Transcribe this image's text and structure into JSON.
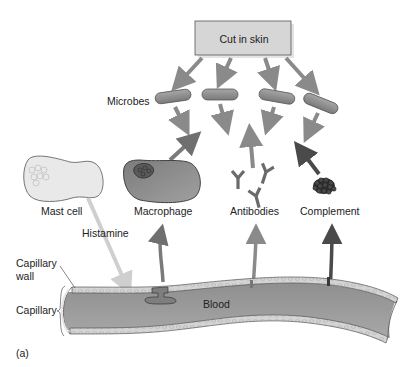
{
  "figure": {
    "panel_label": "(a)",
    "source_box": "Cut in skin",
    "labels": {
      "microbes": "Microbes",
      "mast_cell": "Mast cell",
      "macrophage": "Macrophage",
      "antibodies": "Antibodies",
      "complement": "Complement",
      "histamine": "Histamine",
      "capillary_wall": "Capillary wall",
      "capillary_wall_line1": "Capillary",
      "capillary_wall_line2": "wall",
      "capillary": "Capillary",
      "blood": "Blood"
    },
    "icons": {
      "source_box": "rectangle",
      "microbes": "rod-bacteria-icon",
      "mast_cell": "cell-icon",
      "macrophage": "cell-icon",
      "antibodies": "y-shaped-antibody-icon",
      "complement": "protein-cluster-icon",
      "arrows": "arrow-icon"
    },
    "colors": {
      "box_fill": "#d6d6d6",
      "box_stroke": "#555555",
      "arrow_gray": "#8a8a8a",
      "arrow_dark": "#4a4a4a",
      "histamine_arrow": "#cfcfcf",
      "microbe_fill": "#8c8c8c",
      "mast_cell_fill": "#e8e8e8",
      "macrophage_fill": "#8e8e8e",
      "blood_fill": "#9a9a9a",
      "wall_fill": "#d2d2d2"
    }
  }
}
